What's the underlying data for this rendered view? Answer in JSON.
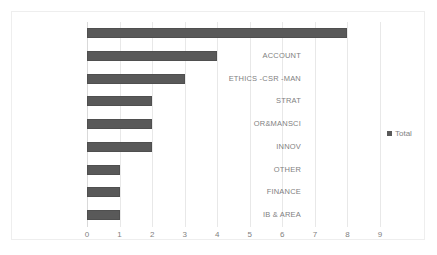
{
  "chart_data": {
    "type": "bar",
    "orientation": "horizontal",
    "title": "",
    "xlabel": "",
    "ylabel": "",
    "categories": [
      "ENT-SBM",
      "ACCOUNT",
      "ETHICS -CSR -MAN",
      "STRAT",
      "OR&MANSCI",
      "INNOV",
      "OTHER",
      "FINANCE",
      "IB & AREA"
    ],
    "values": [
      8,
      4,
      3,
      2,
      2,
      2,
      1,
      1,
      1
    ],
    "series": [
      {
        "name": "Total",
        "values": [
          8,
          4,
          3,
          2,
          2,
          2,
          1,
          1,
          1
        ]
      }
    ],
    "xticks": [
      0,
      1,
      2,
      3,
      4,
      5,
      6,
      7,
      8,
      9
    ],
    "xlim": [
      0,
      9
    ],
    "grid": "vertical",
    "legend": {
      "position": "right",
      "entries": [
        "Total"
      ]
    }
  },
  "legend": {
    "label": "Total"
  },
  "colors": {
    "bar": "#595959",
    "bar_outline": "#4f4f4f",
    "gridline": "#e8e8e8",
    "axis": "#d9d9d9",
    "text": "#7f7f7f",
    "border": "#eeeeee",
    "background": "#ffffff"
  }
}
